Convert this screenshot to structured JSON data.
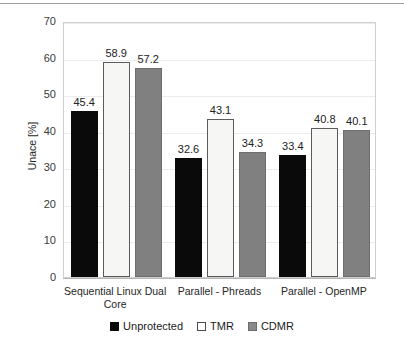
{
  "chart_data": {
    "type": "bar",
    "title": "",
    "subtitle": "",
    "xlabel": "",
    "ylabel": "Unace [%]",
    "ylim": [
      0,
      70
    ],
    "ytick_step": 10,
    "yticks": [
      "70",
      "60",
      "50",
      "40",
      "30",
      "20",
      "10",
      "0"
    ],
    "grid": true,
    "grid_axis": "y",
    "legend_position": "bottom-center",
    "categories": [
      "Sequential Linux Dual Core",
      "Parallel - Phreads",
      "Parallel - OpenMP"
    ],
    "series": [
      {
        "name": "Unprotected",
        "color": "#0a0a0a",
        "values": [
          45.4,
          32.6,
          33.4
        ]
      },
      {
        "name": "TMR",
        "color": "#f6f6f4",
        "values": [
          58.9,
          43.1,
          40.8
        ]
      },
      {
        "name": "CDMR",
        "color": "#808080",
        "values": [
          57.2,
          34.3,
          40.1
        ]
      }
    ],
    "data_labels": [
      [
        "45.4",
        "58.9",
        "57.2"
      ],
      [
        "32.6",
        "43.1",
        "34.3"
      ],
      [
        "33.4",
        "40.8",
        "40.1"
      ]
    ]
  },
  "legend": {
    "items": [
      {
        "label": "Unprotected",
        "swatch": "filled-black-square-icon"
      },
      {
        "label": "TMR",
        "swatch": "outlined-white-square-icon"
      },
      {
        "label": "CDMR",
        "swatch": "filled-gray-square-icon"
      }
    ]
  },
  "colors": {
    "unprotected": "#0a0a0a",
    "tmr": "#f6f6f4",
    "cdmr": "#808080",
    "gridline": "#ececec",
    "axis": "#b7b7b7",
    "text": "#262626"
  }
}
